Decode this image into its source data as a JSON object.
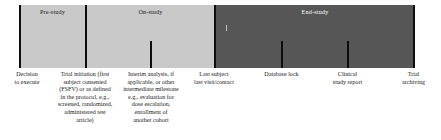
{
  "figure": {
    "colors": {
      "prestudy_band": "#c9c9c9",
      "onstudy_band": "#c9c9c9",
      "endstudy_band": "#565656",
      "tick": "#0d0d0d",
      "page_background": "#ffffff",
      "dark_band_text": "#ffffff",
      "light_band_text": "#1a1a1a"
    }
  },
  "phases": [
    {
      "id": "pre-study",
      "label": "Pre-study",
      "shade": "light"
    },
    {
      "id": "on-study",
      "label": "On-study",
      "shade": "light"
    },
    {
      "id": "end-study",
      "label": "End-study",
      "shade": "dark"
    }
  ],
  "milestones": [
    {
      "id": "decision-to-execute",
      "tick": "full",
      "caption": "Decision\nto execute"
    },
    {
      "id": "trial-initiation",
      "tick": "full",
      "caption": "Trial initiation (first\nsubject consented\n(FSFV) or as defined\nin the protocol, e.g.,\nscreened, randomized,\nadministered test\narticle)"
    },
    {
      "id": "interim-analysis",
      "tick": "short",
      "caption": "Interim analysis, if\napplicable, or other\nintermediate milestone\ne.g., evaluation for\ndose escalation,\nenrollment of\nanother cohort"
    },
    {
      "id": "last-subject-last-visit",
      "tick": "full",
      "caption": "Last subject\nlast visit/contact"
    },
    {
      "id": "database-lock",
      "tick": "short",
      "caption": "Database lock"
    },
    {
      "id": "clinical-study-report",
      "tick": "short",
      "caption": "Clinical\nstudy report"
    },
    {
      "id": "trial-archiving",
      "tick": "full",
      "caption": "Trial\narchiving"
    }
  ]
}
